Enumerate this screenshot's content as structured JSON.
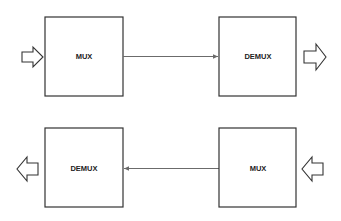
{
  "diagram": {
    "type": "block-diagram",
    "background": "#ffffff",
    "stroke_color": "#333333",
    "connector_color": "#6b6b6b",
    "blocks": [
      {
        "id": "mux_top",
        "label": "MUX",
        "x": 45,
        "y": 17,
        "w": 78,
        "h": 79
      },
      {
        "id": "demux_top",
        "label": "DEMUX",
        "x": 219,
        "y": 17,
        "w": 77,
        "h": 79
      },
      {
        "id": "demux_bottom",
        "label": "DEMUX",
        "x": 45,
        "y": 128,
        "w": 78,
        "h": 79
      },
      {
        "id": "mux_bottom",
        "label": "MUX",
        "x": 219,
        "y": 128,
        "w": 77,
        "h": 79
      }
    ],
    "connections": [
      {
        "from": "mux_top",
        "to": "demux_top",
        "direction": "right"
      },
      {
        "from": "mux_bottom",
        "to": "demux_bottom",
        "direction": "left"
      }
    ],
    "io_arrows": [
      {
        "id": "input_top",
        "target": "mux_top",
        "direction": "right",
        "role": "input"
      },
      {
        "id": "output_top",
        "source": "demux_top",
        "direction": "right",
        "role": "output"
      },
      {
        "id": "output_bottom",
        "source": "demux_bottom",
        "direction": "left",
        "role": "output"
      },
      {
        "id": "input_bottom",
        "target": "mux_bottom",
        "direction": "left",
        "role": "input"
      }
    ]
  },
  "labels": {
    "mux_top": "MUX",
    "demux_top": "DEMUX",
    "demux_bottom": "DEMUX",
    "mux_bottom": "MUX"
  }
}
